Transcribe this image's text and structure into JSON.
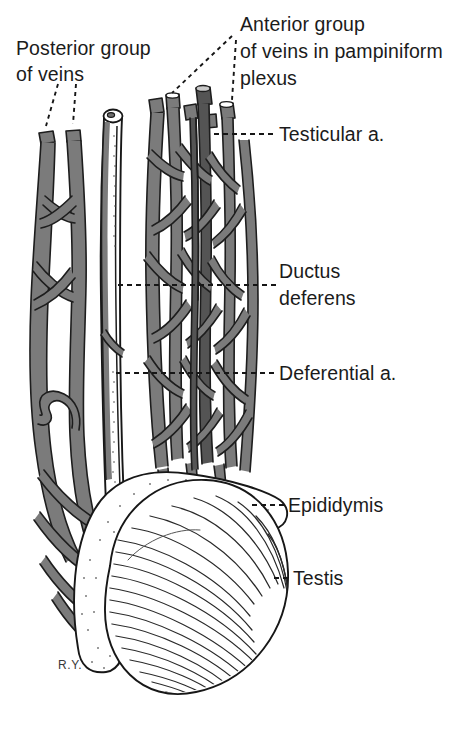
{
  "figure": {
    "background_color": "#ffffff",
    "ink_color": "#1b1b1b",
    "vessel_color": "#7b7b7b",
    "signature": "R.Y."
  },
  "labels": {
    "posterior_group": {
      "line1": "Posterior group",
      "line2": "of veins"
    },
    "anterior_group": {
      "line1": "Anterior group",
      "line2": "of veins in pampiniform",
      "line3": "plexus"
    },
    "testicular_artery": "Testicular a.",
    "ductus_deferens": {
      "line1": "Ductus",
      "line2": "deferens"
    },
    "deferential_artery": "Deferential a.",
    "epididymis": "Epididymis",
    "testis": "Testis"
  },
  "structures": [
    {
      "name": "posterior-group-of-veins",
      "region": "left"
    },
    {
      "name": "ductus-deferens",
      "region": "center-left"
    },
    {
      "name": "anterior-group-of-veins",
      "region": "center-right"
    },
    {
      "name": "testicular-artery",
      "region": "right-upper"
    },
    {
      "name": "deferential-artery",
      "region": "center"
    },
    {
      "name": "epididymis",
      "region": "lower"
    },
    {
      "name": "testis",
      "region": "lower"
    }
  ]
}
